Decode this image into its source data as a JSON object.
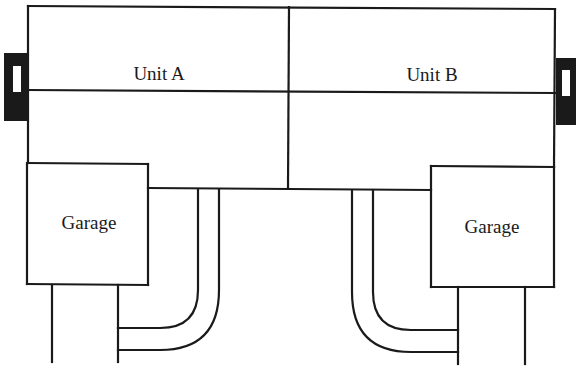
{
  "diagram": {
    "type": "site-plan",
    "stroke_color": "#1a1a1a",
    "background": "#ffffff",
    "units": [
      {
        "id": "A",
        "label": "Unit A",
        "side": "left"
      },
      {
        "id": "B",
        "label": "Unit B",
        "side": "right"
      }
    ],
    "garages": [
      {
        "label": "Garage",
        "attached_to": "Unit A",
        "side": "left"
      },
      {
        "label": "Garage",
        "attached_to": "Unit B",
        "side": "right"
      }
    ],
    "driveways": [
      {
        "serves": "Unit A garage",
        "shape": "curved-L"
      },
      {
        "serves": "Unit B garage",
        "shape": "curved-L"
      }
    ],
    "side_fixtures": [
      {
        "side": "left",
        "fill": "#1a1a1a"
      },
      {
        "side": "right",
        "fill": "#1a1a1a"
      }
    ]
  }
}
